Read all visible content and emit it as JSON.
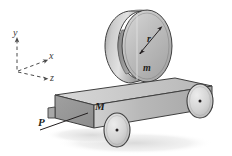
{
  "figure": {
    "name": "cart-with-hoop-diagram",
    "caption": "",
    "background_color": "#ffffff",
    "ink_color": "#231f20"
  },
  "axes": {
    "origin_label": "",
    "y_axis": {
      "label": "y",
      "style": "dashed",
      "direction": "up"
    },
    "x_axis": {
      "label": "x",
      "style": "dashed",
      "direction": "right-up"
    },
    "z_axis": {
      "label": "z",
      "style": "dashed",
      "direction": "right-down"
    }
  },
  "bodies": {
    "cart": {
      "label": "M",
      "description": "rectangular cart block",
      "fill_top": "#c9c9c9",
      "fill_front": "#b4b4b4",
      "fill_side": "#9a9a9a",
      "edge": "#3f3f3f"
    },
    "hoop": {
      "label": "m",
      "radius_label": "r",
      "description": "thin-walled hoop / cylinder resting on cart",
      "fill_face": "#bdbdbd",
      "fill_band": "#a8a8a8",
      "fill_inner": "#8f8f8f",
      "edge": "#3f3f3f"
    },
    "wheels": [
      {
        "name": "front-wheel",
        "fill": "#d2d2d2",
        "hub": "#231f20"
      },
      {
        "name": "rear-wheel",
        "fill": "#d2d2d2",
        "hub": "#231f20"
      }
    ]
  },
  "forces": {
    "applied": {
      "label": "P",
      "description": "applied force at lower-left corner of cart",
      "style": "line"
    }
  },
  "shadow": {
    "color": "#e2e2e2"
  }
}
